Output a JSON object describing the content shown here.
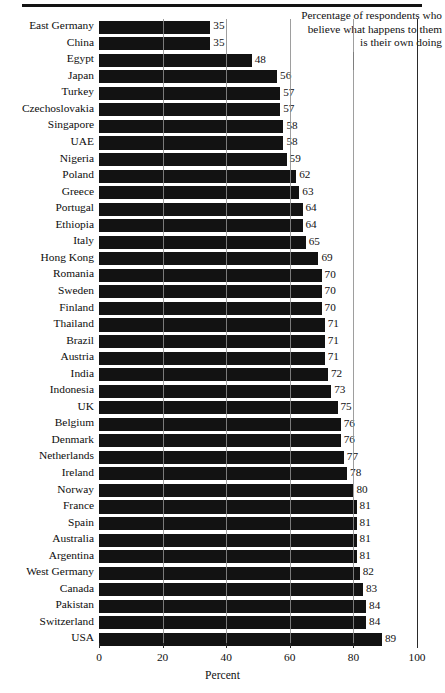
{
  "caption": "Percentage of respondents who\nbelieve what happens to them\nis their own doing",
  "xlabel": "Percent",
  "chart_data": {
    "type": "bar",
    "orientation": "horizontal",
    "title": "Percentage of respondents who believe what happens to them is their own doing",
    "xlabel": "Percent",
    "ylabel": "",
    "xlim": [
      0,
      100
    ],
    "xticks": [
      0,
      20,
      40,
      60,
      80,
      100
    ],
    "xticklabels": [
      "0",
      "20",
      "40",
      "60",
      "80",
      "100"
    ],
    "grid": "vertical",
    "legend": "none",
    "value_labels": true,
    "bar_color": "#121212",
    "categories": [
      "East Germany",
      "China",
      "Egypt",
      "Japan",
      "Turkey",
      "Czechoslovakia",
      "Singapore",
      "UAE",
      "Nigeria",
      "Poland",
      "Greece",
      "Portugal",
      "Ethiopia",
      "Italy",
      "Hong Kong",
      "Romania",
      "Sweden",
      "Finland",
      "Thailand",
      "Brazil",
      "Austria",
      "India",
      "Indonesia",
      "UK",
      "Belgium",
      "Denmark",
      "Netherlands",
      "Ireland",
      "Norway",
      "France",
      "Spain",
      "Australia",
      "Argentina",
      "West Germany",
      "Canada",
      "Pakistan",
      "Switzerland",
      "USA"
    ],
    "values": [
      35,
      35,
      48,
      56,
      57,
      57,
      58,
      58,
      59,
      62,
      63,
      64,
      64,
      65,
      69,
      70,
      70,
      70,
      71,
      71,
      71,
      72,
      73,
      75,
      76,
      76,
      77,
      78,
      80,
      81,
      81,
      81,
      81,
      82,
      83,
      84,
      84,
      89
    ]
  }
}
